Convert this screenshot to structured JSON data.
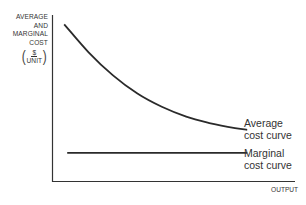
{
  "chart_data": {
    "type": "line",
    "title": "",
    "xlabel": "OUTPUT",
    "ylabel": "AVERAGE AND MARGINAL COST ($/UNIT)",
    "ylabel_lines": [
      "AVERAGE",
      "AND",
      "MARGINAL",
      "COST"
    ],
    "ylabel_unit": {
      "numerator": "$",
      "denominator": "UNIT"
    },
    "axis_ticks": false,
    "grid": false,
    "legend": "inline labels at right end of curves",
    "x": [
      0.05,
      0.15,
      0.25,
      0.35,
      0.45,
      0.55,
      0.65,
      0.75,
      0.8
    ],
    "series": [
      {
        "name": "Average cost curve",
        "label_lines": [
          "Average",
          "cost curve"
        ],
        "shape": "decreasing convex (hyperbolic)",
        "values": [
          0.95,
          0.78,
          0.64,
          0.53,
          0.45,
          0.39,
          0.35,
          0.32,
          0.31
        ]
      },
      {
        "name": "Marginal cost curve",
        "label_lines": [
          "Marginal",
          "cost curve"
        ],
        "shape": "constant horizontal line",
        "values": [
          0.17,
          0.17,
          0.17,
          0.17,
          0.17,
          0.17,
          0.17,
          0.17,
          0.17
        ]
      }
    ],
    "xlim": [
      0,
      1
    ],
    "ylim": [
      0,
      1
    ]
  }
}
